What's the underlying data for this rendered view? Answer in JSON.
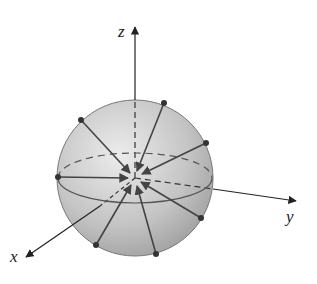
{
  "figure": {
    "axes": {
      "x": {
        "label": "x",
        "tip": [
          25,
          258
        ],
        "label_pos": [
          12,
          261
        ]
      },
      "y": {
        "label": "y",
        "tip": [
          296,
          201
        ],
        "label_pos": [
          286,
          222
        ]
      },
      "z": {
        "label": "z",
        "tip": [
          135,
          26
        ],
        "label_pos": [
          118,
          37
        ]
      }
    },
    "sphere": {
      "cx": 135,
      "cy": 178,
      "r": 78,
      "fill_light": "#e4e4e4",
      "fill_dark": "#9a9a9a",
      "stroke": "#777777"
    },
    "equator": {
      "rx": 77,
      "ry": 25
    },
    "points": [
      {
        "x": 81,
        "y": 120
      },
      {
        "x": 164,
        "y": 103
      },
      {
        "x": 206,
        "y": 143
      },
      {
        "x": 58,
        "y": 177
      },
      {
        "x": 201,
        "y": 218
      },
      {
        "x": 96,
        "y": 245
      },
      {
        "x": 156,
        "y": 254
      }
    ],
    "colors": {
      "arrow": "#444444",
      "axis": "#333333",
      "point": "#333333"
    }
  }
}
